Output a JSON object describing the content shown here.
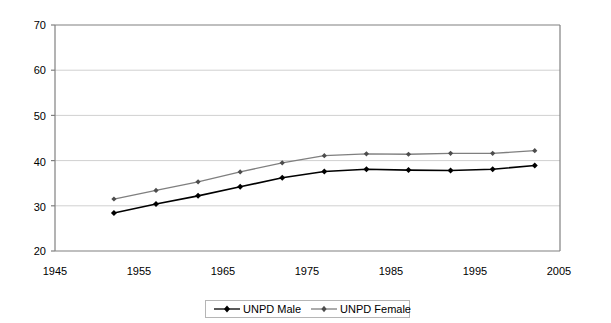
{
  "chart_data": {
    "type": "line",
    "title": "",
    "subtitle": "",
    "xlabel": "",
    "ylabel": "",
    "xlim": [
      1945,
      2005
    ],
    "ylim": [
      20,
      70
    ],
    "xticks": [
      1945,
      1955,
      1965,
      1975,
      1985,
      1995,
      2005
    ],
    "yticks": [
      20,
      30,
      40,
      50,
      60,
      70
    ],
    "grid": "horizontal",
    "legend_position": "bottom-center",
    "x": [
      1952,
      1957,
      1962,
      1967,
      1972,
      1977,
      1982,
      1987,
      1992,
      1997,
      2002
    ],
    "series": [
      {
        "name": "UNPD Male",
        "color": "#000000",
        "marker": "diamond",
        "values": [
          28.4,
          30.4,
          32.2,
          34.2,
          36.2,
          37.6,
          38.1,
          37.9,
          37.8,
          38.1,
          38.9
        ]
      },
      {
        "name": "UNPD Female",
        "color": "#7f7f7f",
        "marker": "diamond",
        "values": [
          31.5,
          33.4,
          35.3,
          37.5,
          39.5,
          41.1,
          41.5,
          41.4,
          41.6,
          41.6,
          42.2
        ]
      }
    ]
  },
  "axes": {
    "ytick_labels": [
      "70",
      "60",
      "50",
      "40",
      "30",
      "20"
    ],
    "xtick_labels": [
      "1945",
      "1955",
      "1965",
      "1975",
      "1985",
      "1995",
      "2005"
    ]
  },
  "legend": {
    "entries": [
      {
        "label": "UNPD Male",
        "color": "#000000"
      },
      {
        "label": "UNPD Female",
        "color": "#7f7f7f"
      }
    ]
  },
  "colors": {
    "male_series": "#000000",
    "female_series": "#7f7f7f",
    "gridline": "#d0d0d0",
    "axis": "#808080",
    "background": "#ffffff"
  }
}
